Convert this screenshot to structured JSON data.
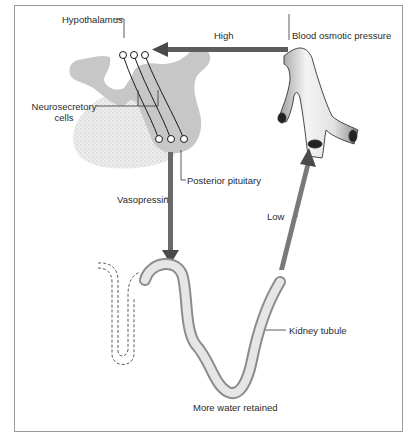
{
  "diagram": {
    "labels": {
      "hypothalamus": "Hypothalamus",
      "high": "High",
      "blood_osmotic_pressure": "Blood osmotic pressure",
      "neurosecretory_line1": "Neurosecretory",
      "neurosecretory_line2": "cells",
      "posterior_pituitary": "Posterior pituitary",
      "vasopressin": "Vasopressin",
      "low": "Low",
      "kidney_tubule": "Kidney tubule",
      "more_water_retained": "More water retained"
    },
    "colors": {
      "tissue_gray": "#c9c9c9",
      "stipple_gray": "#d8d8d8",
      "arrow_dark": "#555555",
      "outline": "#1a1a1a",
      "frame": "#9a9a9a"
    },
    "flow": [
      {
        "from": "Blood osmotic pressure",
        "to": "Hypothalamus",
        "condition": "High"
      },
      {
        "from": "Posterior pituitary",
        "to": "Kidney tubule",
        "signal": "Vasopressin"
      },
      {
        "from": "Kidney tubule",
        "to": "Blood osmotic pressure",
        "condition": "Low"
      }
    ]
  }
}
